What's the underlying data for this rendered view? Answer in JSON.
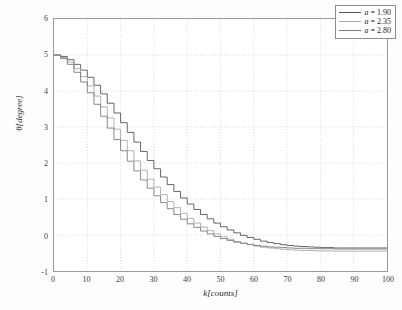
{
  "chart_data": {
    "type": "line",
    "title": "",
    "xlabel": "k[counts]",
    "ylabel": "θ[degree]",
    "xlim": [
      0,
      100
    ],
    "ylim": [
      -1,
      6
    ],
    "xticks": [
      0,
      10,
      20,
      30,
      40,
      50,
      60,
      70,
      80,
      90,
      100
    ],
    "yticks": [
      -1,
      0,
      1,
      2,
      3,
      4,
      5,
      6
    ],
    "grid": "dotted-both-axes",
    "legend_position": "top-right",
    "step_plot": true,
    "x": [
      0,
      2,
      4,
      6,
      8,
      10,
      12,
      14,
      16,
      18,
      20,
      22,
      24,
      26,
      28,
      30,
      32,
      34,
      36,
      38,
      40,
      42,
      44,
      46,
      48,
      50,
      52,
      54,
      56,
      58,
      60,
      62,
      64,
      66,
      68,
      70,
      72,
      74,
      76,
      78,
      80,
      82,
      84,
      86,
      88,
      90,
      92,
      94,
      96,
      98,
      100
    ],
    "series": [
      {
        "name": "a = 1.90",
        "label_var": "a",
        "label_value": "1.90",
        "color": "#555555",
        "values": [
          5.0,
          4.96,
          4.87,
          4.74,
          4.58,
          4.38,
          4.16,
          3.92,
          3.66,
          3.39,
          3.12,
          2.85,
          2.58,
          2.32,
          2.07,
          1.84,
          1.61,
          1.4,
          1.21,
          1.03,
          0.86,
          0.71,
          0.57,
          0.45,
          0.33,
          0.23,
          0.14,
          0.06,
          -0.01,
          -0.07,
          -0.12,
          -0.17,
          -0.21,
          -0.24,
          -0.27,
          -0.29,
          -0.31,
          -0.32,
          -0.33,
          -0.34,
          -0.35,
          -0.35,
          -0.36,
          -0.36,
          -0.36,
          -0.36,
          -0.36,
          -0.36,
          -0.36,
          -0.36,
          -0.36
        ]
      },
      {
        "name": "a = 2.35",
        "label_var": "a",
        "label_value": "2.35",
        "color": "#a8a8a8",
        "values": [
          5.0,
          4.93,
          4.8,
          4.62,
          4.4,
          4.14,
          3.86,
          3.56,
          3.25,
          2.94,
          2.63,
          2.34,
          2.06,
          1.8,
          1.55,
          1.33,
          1.12,
          0.93,
          0.76,
          0.6,
          0.46,
          0.33,
          0.22,
          0.12,
          0.03,
          -0.05,
          -0.12,
          -0.18,
          -0.23,
          -0.27,
          -0.31,
          -0.34,
          -0.36,
          -0.38,
          -0.4,
          -0.41,
          -0.42,
          -0.43,
          -0.43,
          -0.44,
          -0.44,
          -0.44,
          -0.45,
          -0.45,
          -0.45,
          -0.45,
          -0.45,
          -0.45,
          -0.45,
          -0.45,
          -0.45
        ]
      },
      {
        "name": "a = 2.80",
        "label_var": "a",
        "label_value": "2.80",
        "color": "#7a7a7a",
        "values": [
          5.0,
          4.9,
          4.74,
          4.52,
          4.25,
          3.95,
          3.63,
          3.3,
          2.97,
          2.65,
          2.34,
          2.05,
          1.78,
          1.53,
          1.3,
          1.09,
          0.9,
          0.73,
          0.57,
          0.44,
          0.31,
          0.21,
          0.11,
          0.03,
          -0.04,
          -0.1,
          -0.15,
          -0.2,
          -0.23,
          -0.26,
          -0.29,
          -0.31,
          -0.33,
          -0.34,
          -0.35,
          -0.36,
          -0.37,
          -0.37,
          -0.38,
          -0.38,
          -0.38,
          -0.38,
          -0.39,
          -0.39,
          -0.39,
          -0.39,
          -0.39,
          -0.39,
          -0.39,
          -0.39,
          -0.39
        ]
      }
    ]
  },
  "legend": {
    "entries": [
      {
        "text": "a = 1.90"
      },
      {
        "text": "a = 2.35"
      },
      {
        "text": "a = 2.80"
      }
    ]
  },
  "axes": {
    "x_label": "k[counts]",
    "y_label": "θ[degree]"
  }
}
